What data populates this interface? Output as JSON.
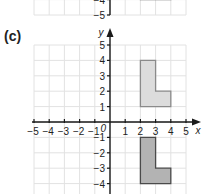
{
  "part_label": "(c)",
  "previous_graph_fragment": {
    "visible_y_ticks": [
      "-4",
      "-5"
    ],
    "shape_bottom_edge": {
      "x_from": 2,
      "x_to": 4,
      "y": -4
    }
  },
  "graph": {
    "x_axis_label": "x",
    "y_axis_label": "y",
    "origin_label": "0",
    "x_ticks": [
      "-5",
      "-4",
      "-3",
      "-2",
      "-1",
      "1",
      "2",
      "3",
      "4",
      "5"
    ],
    "y_ticks": [
      "5",
      "4",
      "3",
      "2",
      "1",
      "-1",
      "-2",
      "-3",
      "-4"
    ],
    "x_range": [
      -5,
      5
    ],
    "y_range": [
      -5,
      5
    ],
    "grid": true
  },
  "shapes": [
    {
      "name": "object-L-shape",
      "vertices": [
        [
          2,
          1
        ],
        [
          2,
          4
        ],
        [
          3,
          4
        ],
        [
          3,
          2
        ],
        [
          4,
          2
        ],
        [
          4,
          1
        ]
      ],
      "fill": "#dcdcdc",
      "stroke": "#8a8a8a"
    },
    {
      "name": "image-L-shape-reflected",
      "vertices": [
        [
          2,
          -1
        ],
        [
          3,
          -1
        ],
        [
          3,
          -3
        ],
        [
          4,
          -3
        ],
        [
          4,
          -4
        ],
        [
          2,
          -4
        ]
      ],
      "fill": "#b3b3b3",
      "stroke": "#4a4a4a"
    }
  ],
  "colors": {
    "grid": "#e2e2e2",
    "axis": "#1a1a1a",
    "text": "#222222"
  }
}
